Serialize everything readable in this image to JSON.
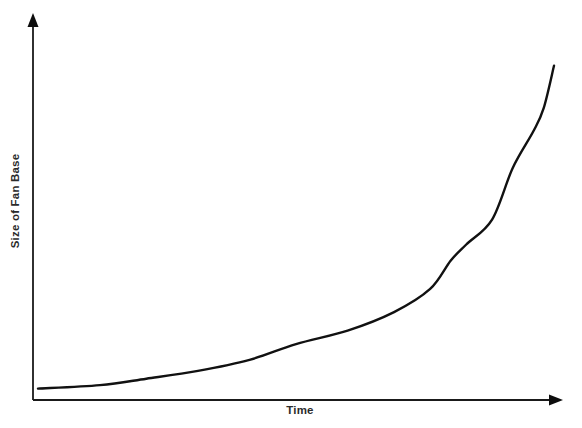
{
  "chart_data": {
    "type": "line",
    "title": "",
    "subtitle": "",
    "xlabel": "Time",
    "ylabel": "Size of Fan Base",
    "legend": [],
    "legend_position": "none",
    "grid": false,
    "tick_labels_x": [],
    "tick_labels_y": [],
    "xlim": [
      0,
      1
    ],
    "ylim": [
      0,
      1
    ],
    "annotations": [],
    "series": [
      {
        "name": "Fan Base Growth",
        "color": "#111111",
        "x": [
          0.0,
          0.12,
          0.21,
          0.31,
          0.41,
          0.5,
          0.6,
          0.69,
          0.76,
          0.8,
          0.83,
          0.88,
          0.92,
          0.96,
          0.98,
          1.0
        ],
        "y": [
          0.015,
          0.025,
          0.043,
          0.065,
          0.096,
          0.14,
          0.178,
          0.23,
          0.295,
          0.375,
          0.42,
          0.49,
          0.635,
          0.738,
          0.803,
          0.922
        ]
      }
    ]
  },
  "axes": {
    "y_axis_name": "vertical-axis",
    "x_axis_name": "horizontal-axis",
    "arrow_style": "filled-triangle",
    "axis_color": "#1a1a1a"
  },
  "canvas": {
    "width": 582,
    "height": 428,
    "background": "#ffffff"
  }
}
